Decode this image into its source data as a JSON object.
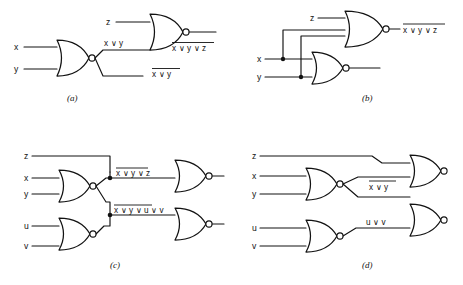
{
  "figure": {
    "background_color": "#ffffff",
    "line_color": "#121212",
    "subfigures": [
      {
        "id": "a",
        "caption": "(a)",
        "description": "Two-level NOR network: 2-input NOR of x and y feeds a 2-input NOR with z",
        "inputs": [
          "x",
          "y",
          "z"
        ],
        "gates": [
          {
            "name": "nor-gate-a1",
            "type": "NOR",
            "inputs": [
              "x",
              "y"
            ],
            "output": "x∨y"
          },
          {
            "name": "nor-gate-a2",
            "type": "NOR",
            "inputs": [
              "z",
              "x∨y"
            ],
            "output": "x∨y∨z"
          }
        ],
        "labels": [
          {
            "name": "input-x",
            "text": "x"
          },
          {
            "name": "input-y",
            "text": "y"
          },
          {
            "name": "input-z",
            "text": "z"
          },
          {
            "name": "internal-wire-label",
            "text": "x ∨ y",
            "overbar": false
          },
          {
            "name": "output-bottom",
            "text": "x ∨ y",
            "overbar": true
          },
          {
            "name": "output-top",
            "text": "x ∨ y ∨ z",
            "overbar": true
          }
        ]
      },
      {
        "id": "b",
        "caption": "(b)",
        "description": "Single 3-input NOR gate with z, x, y plus a 2-input NOR of x and y; junction dots on the x and y lines",
        "inputs": [
          "x",
          "y",
          "z"
        ],
        "gates": [
          {
            "name": "nor-gate-b1",
            "type": "NOR",
            "inputs": [
              "z",
              "x",
              "y"
            ],
            "output": "x∨y∨z"
          },
          {
            "name": "nor-gate-b2",
            "type": "NOR",
            "inputs": [
              "x",
              "y"
            ],
            "output": "x∨y"
          }
        ],
        "labels": [
          {
            "name": "input-x",
            "text": "x"
          },
          {
            "name": "input-y",
            "text": "y"
          },
          {
            "name": "input-z",
            "text": "z"
          },
          {
            "name": "output-top",
            "text": "x ∨ y ∨ z",
            "overbar": true
          }
        ]
      },
      {
        "id": "c",
        "caption": "(c)",
        "description": "NOR of x,y fans out to two downstream NOR gates; one combines with z, the other with the NOR of u,v",
        "inputs": [
          "x",
          "y",
          "z",
          "u",
          "v"
        ],
        "gates": [
          {
            "name": "nor-gate-c1",
            "type": "NOR",
            "inputs": [
              "x",
              "y"
            ],
            "output": "x∨y"
          },
          {
            "name": "nor-gate-c2",
            "type": "NOR",
            "inputs": [
              "u",
              "v"
            ],
            "output": "u∨v"
          },
          {
            "name": "nor-gate-c3",
            "type": "NOR",
            "inputs": [
              "z",
              "x∨y"
            ],
            "output": "x∨y∨z"
          },
          {
            "name": "nor-gate-c4",
            "type": "NOR",
            "inputs": [
              "x∨y",
              "u∨v"
            ],
            "output": "x∨y∨u∨v"
          }
        ],
        "labels": [
          {
            "name": "input-z",
            "text": "z"
          },
          {
            "name": "input-x",
            "text": "x"
          },
          {
            "name": "input-y",
            "text": "y"
          },
          {
            "name": "input-u",
            "text": "u"
          },
          {
            "name": "input-v",
            "text": "v"
          },
          {
            "name": "wire-label-upper",
            "text": "x ∨ y ∨ z",
            "overbar": true
          },
          {
            "name": "wire-label-lower",
            "text": "x ∨ y ∨ u ∨ v",
            "overbar": true
          }
        ]
      },
      {
        "id": "d",
        "caption": "(d)",
        "description": "NOR of x,y and NOR of u,v cross over to feed two output NOR gates; z routes to the top gate",
        "inputs": [
          "x",
          "y",
          "z",
          "u",
          "v"
        ],
        "gates": [
          {
            "name": "nor-gate-d1",
            "type": "NOR",
            "inputs": [
              "x",
              "y"
            ],
            "output": "x∨y"
          },
          {
            "name": "nor-gate-d2",
            "type": "NOR",
            "inputs": [
              "u",
              "v"
            ],
            "output": "u∨v"
          },
          {
            "name": "nor-gate-d3",
            "type": "NOR",
            "inputs": [
              "z",
              "x∨y"
            ],
            "output": ""
          },
          {
            "name": "nor-gate-d4",
            "type": "NOR",
            "inputs": [
              "x∨y",
              "u∨v"
            ],
            "output": ""
          }
        ],
        "labels": [
          {
            "name": "input-z",
            "text": "z"
          },
          {
            "name": "input-x",
            "text": "x"
          },
          {
            "name": "input-y",
            "text": "y"
          },
          {
            "name": "input-u",
            "text": "u"
          },
          {
            "name": "input-v",
            "text": "v"
          },
          {
            "name": "wire-label-upper",
            "text": "x ∨ y",
            "overbar": true
          },
          {
            "name": "wire-label-lower",
            "text": "u ∨ v",
            "overbar": false
          }
        ]
      }
    ]
  }
}
